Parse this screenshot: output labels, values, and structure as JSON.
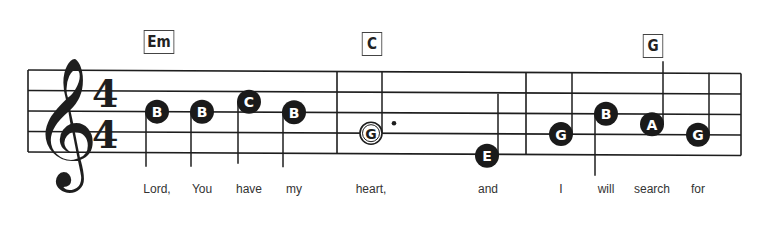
{
  "score": {
    "clef": "treble",
    "time_signature": {
      "top": "4",
      "bottom": "4"
    },
    "colors": {
      "ink": "#1e1e1e",
      "note_fill": "#1a1a1a",
      "note_text": "#ffffff",
      "lyric": "#333333"
    },
    "chords": [
      {
        "label": "Em",
        "at_note": 0
      },
      {
        "label": "C",
        "at_note": 4
      },
      {
        "label": "G",
        "at_note": 8
      }
    ],
    "measures": [
      {
        "notes": [
          0,
          1,
          2,
          3
        ]
      },
      {
        "notes": [
          4,
          5
        ]
      },
      {
        "notes": [
          6,
          7,
          8,
          9
        ]
      }
    ],
    "notes": [
      {
        "letter": "B",
        "duration": "quarter",
        "style": "filled",
        "lyric": "Lord,"
      },
      {
        "letter": "B",
        "duration": "quarter",
        "style": "filled",
        "lyric": "You"
      },
      {
        "letter": "C",
        "duration": "quarter",
        "style": "filled",
        "lyric": "have"
      },
      {
        "letter": "B",
        "duration": "quarter",
        "style": "filled",
        "lyric": "my"
      },
      {
        "letter": "G",
        "duration": "dotted-half",
        "style": "hollow",
        "lyric": "heart,"
      },
      {
        "letter": "E",
        "duration": "quarter",
        "style": "filled",
        "lyric": "and"
      },
      {
        "letter": "G",
        "duration": "quarter",
        "style": "filled",
        "lyric": "I"
      },
      {
        "letter": "B",
        "duration": "quarter",
        "style": "filled",
        "lyric": "will"
      },
      {
        "letter": "A",
        "duration": "quarter",
        "style": "filled",
        "lyric": "search"
      },
      {
        "letter": "G",
        "duration": "quarter",
        "style": "filled",
        "lyric": "for"
      }
    ]
  }
}
